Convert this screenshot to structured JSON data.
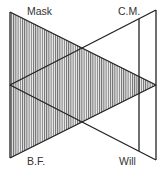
{
  "diagram": {
    "labels": {
      "top_left": "Mask",
      "top_right": "C.M.",
      "bottom_left": "B.F.",
      "bottom_right": "Will"
    },
    "colors": {
      "line": "#222222",
      "hatch": "#555555",
      "background": "#ffffff"
    }
  }
}
